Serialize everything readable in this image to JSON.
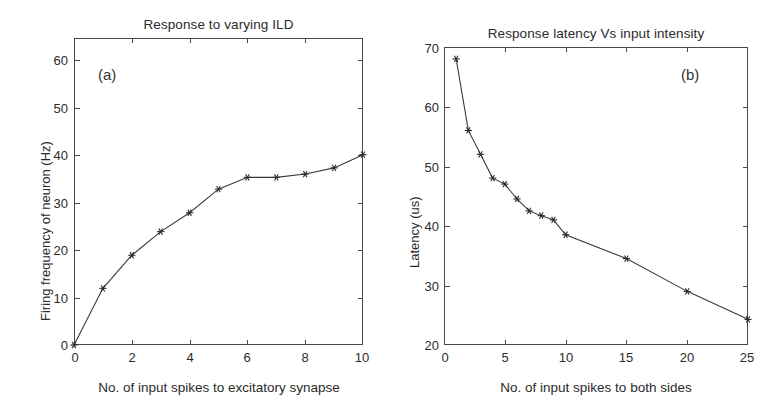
{
  "figure": {
    "panel_a": {
      "letter": "(a)",
      "title": "Response to varying ILD",
      "xlabel": "No. of input spikes to excitatory synapse",
      "ylabel": "Firing frequency of neuron (Hz)",
      "xticks": [
        "0",
        "2",
        "4",
        "6",
        "8",
        "10"
      ],
      "yticks": [
        "0",
        "10",
        "20",
        "30",
        "40",
        "50",
        "60"
      ]
    },
    "panel_b": {
      "letter": "(b)",
      "title": "Response latency Vs input intensity",
      "xlabel": "No. of input spikes to both sides",
      "ylabel": "Latency (us)",
      "xticks": [
        "0",
        "5",
        "10",
        "15",
        "20",
        "25"
      ],
      "yticks": [
        "20",
        "30",
        "40",
        "50",
        "60",
        "70"
      ]
    },
    "line_color": "#3a3a3a",
    "axis_color": "#4a4a4a",
    "marker_symbol": "asterisk"
  },
  "chart_data": [
    {
      "type": "line",
      "title": "Response to varying ILD",
      "xlabel": "No. of input spikes to excitatory synapse",
      "ylabel": "Firing frequency of neuron (Hz)",
      "xlim": [
        0,
        10
      ],
      "ylim": [
        0,
        65
      ],
      "xticks": [
        0,
        2,
        4,
        6,
        8,
        10
      ],
      "yticks": [
        0,
        10,
        20,
        30,
        40,
        50,
        60
      ],
      "grid": false,
      "legend": "none",
      "marker": "asterisk",
      "annotations": [
        "(a)"
      ],
      "x": [
        0,
        1,
        2,
        3,
        4,
        5,
        6,
        7,
        8,
        9,
        10
      ],
      "y": [
        0,
        12,
        19,
        24,
        28,
        33,
        35.5,
        35.5,
        36.2,
        37.5,
        40.3
      ]
    },
    {
      "type": "line",
      "title": "Response latency Vs input intensity",
      "xlabel": "No. of input spikes to both sides",
      "ylabel": "Latency (us)",
      "xlim": [
        0,
        25
      ],
      "ylim": [
        20,
        70
      ],
      "xticks": [
        0,
        5,
        10,
        15,
        20,
        25
      ],
      "yticks": [
        20,
        30,
        40,
        50,
        60,
        70
      ],
      "grid": false,
      "legend": "none",
      "marker": "asterisk",
      "annotations": [
        "(b)"
      ],
      "x": [
        1,
        2,
        3,
        4,
        5,
        6,
        7,
        8,
        9,
        10,
        15,
        20,
        25
      ],
      "y": [
        68,
        56,
        52,
        48,
        47,
        44.5,
        42.5,
        41.7,
        41,
        38.5,
        34.5,
        29,
        24.3
      ]
    }
  ]
}
